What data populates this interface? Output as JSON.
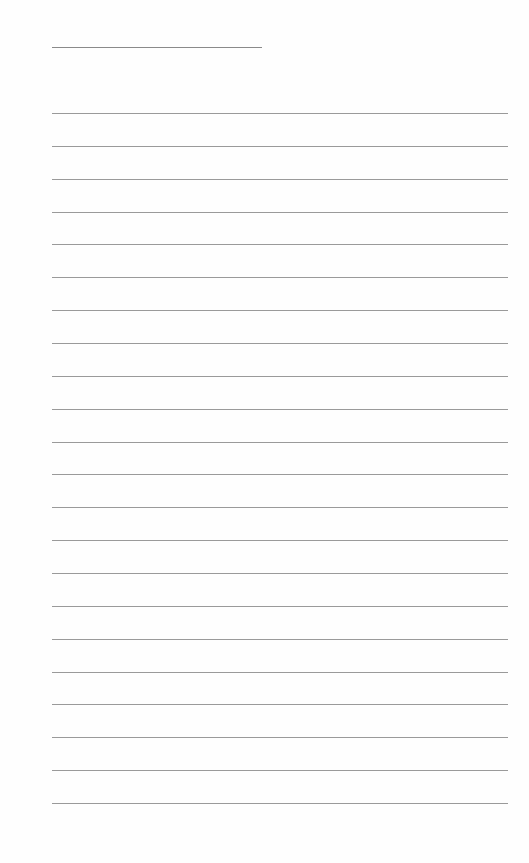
{
  "page": {
    "type": "blank lined notebook page",
    "background_color": "#ffffff",
    "line_color": "#9a9a9a",
    "title_line": {
      "present": true,
      "text": ""
    },
    "ruled_lines": {
      "count": 22,
      "first_y": 113,
      "spacing": 32.86,
      "left": 52,
      "right": 508
    }
  }
}
